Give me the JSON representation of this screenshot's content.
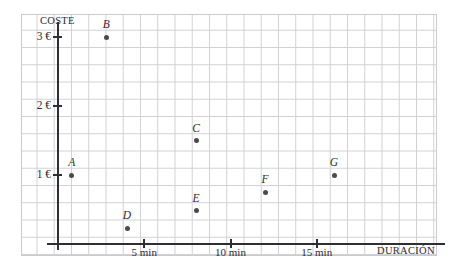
{
  "chart_data": {
    "type": "scatter",
    "title": "",
    "xlabel": "DURACIÓN",
    "ylabel": "COSTE",
    "xlim": [
      0,
      22
    ],
    "ylim": [
      0,
      3.3
    ],
    "grid": true,
    "legend": "none",
    "x_unit": "min",
    "y_unit": "€",
    "x_ticks": [
      {
        "value": 5,
        "label": "5 min"
      },
      {
        "value": 10,
        "label": "10 min"
      },
      {
        "value": 15,
        "label": "15 min"
      }
    ],
    "y_ticks": [
      {
        "value": 1,
        "label": "1 €"
      },
      {
        "value": 2,
        "label": "2 €"
      },
      {
        "value": 3,
        "label": "3 €"
      }
    ],
    "points": [
      {
        "name": "A",
        "x": 0.8,
        "y": 1.0
      },
      {
        "name": "B",
        "x": 2.8,
        "y": 3.0
      },
      {
        "name": "C",
        "x": 8.0,
        "y": 1.5
      },
      {
        "name": "D",
        "x": 4.0,
        "y": 0.23
      },
      {
        "name": "E",
        "x": 8.0,
        "y": 0.48
      },
      {
        "name": "F",
        "x": 12.0,
        "y": 0.75
      },
      {
        "name": "G",
        "x": 16.0,
        "y": 1.0
      }
    ],
    "colors": {
      "point": "#4a4a52",
      "axis": "#2f2f33",
      "grid": "#c9c9cf",
      "text": "#2b2b30",
      "background": "#ffffff"
    }
  }
}
